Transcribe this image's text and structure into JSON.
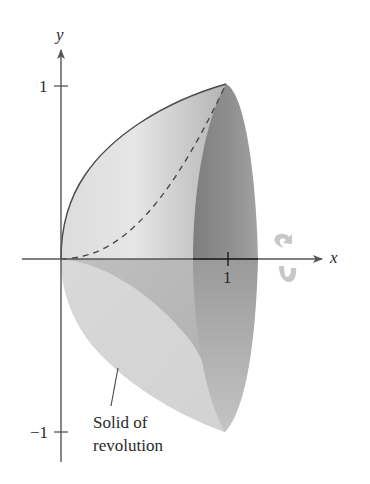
{
  "figure": {
    "axes": {
      "x_label": "x",
      "y_label": "y",
      "x_ticks": [
        {
          "value": 1,
          "label": "1"
        }
      ],
      "y_ticks": [
        {
          "value": 1,
          "label": "1"
        },
        {
          "value": -1,
          "label": "−1"
        }
      ]
    },
    "curves": {
      "outer": "y = sqrt(x)",
      "inner_dashed": "y = x^2"
    },
    "annotation": {
      "line1": "Solid of",
      "line2": "revolution"
    },
    "rotation_icon": "rotate-about-x-axis-icon",
    "colors": {
      "solid_light": "#d4d4d4",
      "solid_mid": "#bdbdbd",
      "end_cap": "#8c8c8c",
      "axis": "#555555",
      "outline": "#4a4a4a"
    }
  }
}
